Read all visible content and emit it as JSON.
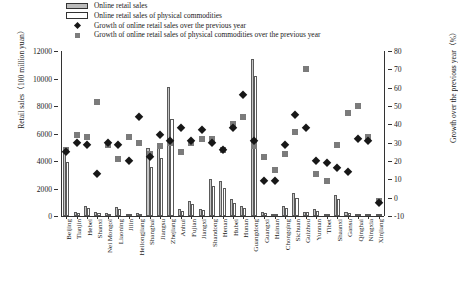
{
  "legend": {
    "items": [
      {
        "key": "swatch-gray",
        "label": "Online retail sales"
      },
      {
        "key": "swatch-white",
        "label": "Online retail sales of physical commodities"
      },
      {
        "key": "marker-diamond",
        "label": "Growth of  online retail sales over the previous year"
      },
      {
        "key": "marker-square",
        "label": "Growth of online retail sales of physical commodities over the previous year"
      }
    ]
  },
  "colors": {
    "bar_sales": "#c6c6c6",
    "bar_physical": "#ffffff",
    "marker_diamond": "#171717",
    "marker_square": "#7b7b7b",
    "axis": "#333333"
  },
  "chart_data": {
    "type": "bar",
    "title": "",
    "xlabel": "",
    "ylabel": "Retail sales（100 million yuan）",
    "y2label": "Growth over the previous year（%）",
    "ylim": [
      0,
      12000
    ],
    "yticks": [
      0,
      2000,
      4000,
      6000,
      8000,
      10000,
      12000
    ],
    "y2lim": [
      -10,
      80
    ],
    "y2ticks": [
      -10,
      0,
      10,
      20,
      30,
      40,
      50,
      60,
      70,
      80
    ],
    "grid": false,
    "legend_position": "top",
    "categories": [
      "Beijing",
      "Tianjin",
      "Hebei",
      "Shanxi",
      "Nei Mongol",
      "Liaoning",
      "Jilin",
      "Heilongjiang",
      "Shanghai",
      "Jiangsu",
      "Zhejiang",
      "Anhui",
      "Fujian",
      "Jiangxi",
      "Shandong",
      "Henan",
      "Hubei",
      "Hunan",
      "Guangdong",
      "Guangxi",
      "Hainan",
      "Chongqing",
      "Sichuan",
      "Guizhou",
      "Yunnan",
      "Tibet",
      "Shaanxi",
      "Gansu",
      "Qinghai",
      "Ningxia",
      "Xinjiang"
    ],
    "series": [
      {
        "name": "Online retail sales",
        "unit": "100 million yuan",
        "axis": "left",
        "values": [
          5020,
          310,
          700,
          300,
          220,
          620,
          180,
          210,
          4980,
          5020,
          9400,
          480,
          1100,
          520,
          2680,
          2520,
          1220,
          700,
          11400,
          290,
          180,
          740,
          1670,
          320,
          490,
          25,
          1520,
          260,
          60,
          130,
          150
        ]
      },
      {
        "name": "Online retail sales of physical commodities",
        "unit": "100 million yuan",
        "axis": "left",
        "values": [
          3900,
          240,
          560,
          240,
          170,
          500,
          140,
          170,
          3600,
          4250,
          7050,
          390,
          880,
          420,
          2180,
          2010,
          980,
          560,
          10200,
          230,
          140,
          600,
          1320,
          260,
          390,
          20,
          1220,
          210,
          48,
          105,
          120
        ]
      },
      {
        "name": "Growth of online retail sales over the previous year",
        "unit": "%",
        "axis": "right",
        "values": [
          25,
          30,
          29,
          13,
          30,
          29,
          20,
          44,
          22,
          34,
          31,
          38,
          31,
          37,
          30,
          26,
          38,
          56,
          31,
          9,
          9,
          29,
          45,
          38,
          20,
          19,
          16,
          14,
          32,
          31,
          -3
        ]
      },
      {
        "name": "Growth of online retail sales of physical commodities over the previous year",
        "unit": "%",
        "axis": "right",
        "values": [
          26,
          34,
          33,
          52,
          29,
          21,
          33,
          30,
          24,
          28,
          30,
          25,
          30,
          32,
          32,
          26,
          40,
          44,
          28,
          22,
          15,
          24,
          36,
          70,
          13,
          9,
          29,
          46,
          50,
          33,
          -2
        ]
      }
    ]
  }
}
